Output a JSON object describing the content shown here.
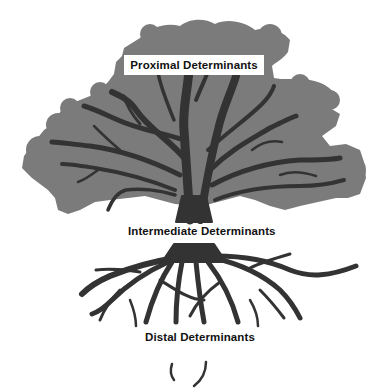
{
  "diagram": {
    "type": "tree-metaphor",
    "colors": {
      "canopy": "#7b7b7b",
      "branches": "#333333",
      "background": "#ffffff",
      "label_box": "#ffffff",
      "label_text": "#111111"
    },
    "labels": {
      "proximal": "Proximal Determinants",
      "intermediate": "Intermediate Determinants",
      "distal": "Distal Determinants"
    },
    "regions": [
      {
        "name": "canopy",
        "label_key": "proximal"
      },
      {
        "name": "trunk",
        "label_key": "intermediate"
      },
      {
        "name": "roots",
        "label_key": "distal"
      }
    ]
  }
}
